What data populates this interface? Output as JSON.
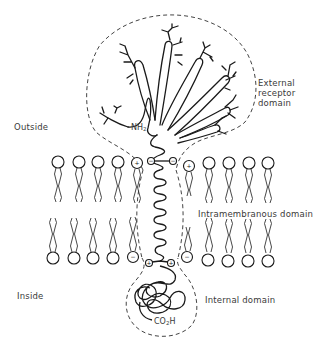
{
  "diagram": {
    "type": "membrane-receptor-schematic",
    "labels": {
      "outside": "Outside",
      "inside": "Inside",
      "external_domain": [
        "External",
        "receptor",
        "domain"
      ],
      "intramembranous_domain": "Intramembranous domain",
      "internal_domain": "Internal domain",
      "n_terminus": "NH",
      "n_terminus_sub": "2",
      "c_terminus_pre": "CO",
      "c_terminus_sub": "2",
      "c_terminus_post": "H"
    },
    "charges": {
      "outer_leaflet": [
        "+",
        "−",
        "−",
        "+"
      ],
      "inner_leaflet": [
        "−",
        "+",
        "+",
        "−"
      ]
    },
    "colors": {
      "line": "#1a1a1a",
      "dashed": "#444444",
      "text": "#3a3a3a",
      "background": "#ffffff"
    }
  }
}
